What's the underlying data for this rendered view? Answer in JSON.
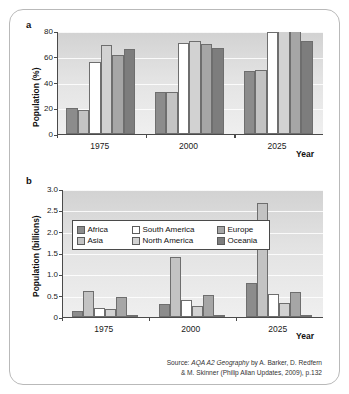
{
  "figure": {
    "panel_a_letter": "a",
    "panel_b_letter": "b",
    "source_line_1_prefix": "Source: ",
    "source_line_1_italic": "AQA A2 Geography",
    "source_line_1_rest": " by A. Barker, D. Redfern",
    "source_line_2": "& M. Skinner (Philip Allan Updates, 2009), p.132"
  },
  "series_colors": {
    "africa": "#8c8c8c",
    "asia": "#c3c3c3",
    "south_america": "#ffffff",
    "north_america": "#d2d2d2",
    "europe": "#a6a6a6",
    "oceania": "#7d7d7d"
  },
  "legend": {
    "entries": [
      {
        "label": "Africa",
        "color": "#8c8c8c"
      },
      {
        "label": "South America",
        "color": "#ffffff"
      },
      {
        "label": "Europe",
        "color": "#a6a6a6"
      },
      {
        "label": "Asia",
        "color": "#c3c3c3"
      },
      {
        "label": "North America",
        "color": "#d2d2d2"
      },
      {
        "label": "Oceania",
        "color": "#7d7d7d"
      }
    ]
  },
  "chart_data": [
    {
      "id": "panel-a",
      "type": "bar",
      "title": "",
      "xlabel": "Year",
      "ylabel": "Population (%)",
      "ylim": [
        0,
        80
      ],
      "yticks": [
        0,
        20,
        40,
        60,
        80
      ],
      "ytick_labels": [
        "0",
        "20",
        "40",
        "60",
        "80"
      ],
      "grid": true,
      "legend_position": "none",
      "categories": [
        "1975",
        "2000",
        "2025"
      ],
      "series": [
        {
          "name": "Africa",
          "color": "#8c8c8c",
          "values": [
            20,
            33,
            49
          ]
        },
        {
          "name": "Asia",
          "color": "#c3c3c3",
          "values": [
            19,
            33,
            50
          ]
        },
        {
          "name": "South America",
          "color": "#ffffff",
          "values": [
            56,
            71,
            79
          ]
        },
        {
          "name": "North America",
          "color": "#d2d2d2",
          "values": [
            69,
            72,
            81
          ]
        },
        {
          "name": "Europe",
          "color": "#a6a6a6",
          "values": [
            61,
            70,
            80
          ]
        },
        {
          "name": "Oceania",
          "color": "#7d7d7d",
          "values": [
            66,
            67,
            72
          ]
        }
      ]
    },
    {
      "id": "panel-b",
      "type": "bar",
      "title": "",
      "xlabel": "Year",
      "ylabel": "Population (billions)",
      "ylim": [
        0,
        3.0
      ],
      "yticks": [
        0,
        0.5,
        1.0,
        1.5,
        2.0,
        2.5,
        3.0
      ],
      "ytick_labels": [
        "0",
        "0.5",
        "1.0",
        "1.5",
        "2.0",
        "2.5",
        "3.0"
      ],
      "grid": true,
      "legend_position": "upper-left-inside",
      "categories": [
        "1975",
        "2000",
        "2025"
      ],
      "series": [
        {
          "name": "Africa",
          "color": "#8c8c8c",
          "values": [
            0.13,
            0.31,
            0.8
          ]
        },
        {
          "name": "Asia",
          "color": "#c3c3c3",
          "values": [
            0.61,
            1.4,
            2.68
          ]
        },
        {
          "name": "South America",
          "color": "#ffffff",
          "values": [
            0.2,
            0.39,
            0.53
          ]
        },
        {
          "name": "North America",
          "color": "#d2d2d2",
          "values": [
            0.19,
            0.25,
            0.33
          ]
        },
        {
          "name": "Europe",
          "color": "#a6a6a6",
          "values": [
            0.47,
            0.51,
            0.58
          ]
        },
        {
          "name": "Oceania",
          "color": "#7d7d7d",
          "values": [
            0.02,
            0.02,
            0.04
          ]
        }
      ]
    }
  ]
}
